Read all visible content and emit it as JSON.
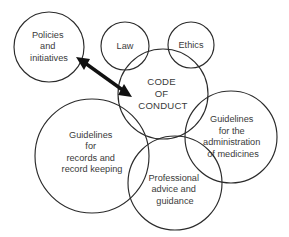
{
  "diagram": {
    "type": "venn-overlapping-circles",
    "title_text": "CODE OF CONDUCT",
    "stroke_color": "#2b2b2b",
    "text_color": "#3a3a3a",
    "arrow_color": "#111111",
    "background_color": "#ffffff",
    "nodes": [
      {
        "id": "policies",
        "name": "policies-and-initiatives",
        "lines": [
          "Policies",
          "and",
          "initiatives"
        ],
        "cx": 49,
        "cy": 47,
        "r": 35
      },
      {
        "id": "law",
        "name": "law",
        "lines": [
          "Law"
        ],
        "cx": 125,
        "cy": 46,
        "r": 24
      },
      {
        "id": "ethics",
        "name": "ethics",
        "lines": [
          "Ethics"
        ],
        "cx": 191,
        "cy": 45,
        "r": 23
      },
      {
        "id": "code-of-conduct",
        "name": "code-of-conduct",
        "lines": [
          "CODE",
          "OF",
          "CONDUCT"
        ],
        "cx": 163,
        "cy": 94,
        "r": 45
      },
      {
        "id": "records",
        "name": "guidelines-for-records-and-record-keeping",
        "lines": [
          "Guidelines",
          "for",
          "records and",
          "record keeping"
        ],
        "cx": 92,
        "cy": 156,
        "r": 57
      },
      {
        "id": "medicines",
        "name": "guidelines-for-the-administration-of-medicines",
        "lines": [
          "Guidelines",
          "for the",
          "administration",
          "of medicines"
        ],
        "cx": 231,
        "cy": 137,
        "r": 46
      },
      {
        "id": "professional",
        "name": "professional-advice-and-guidance",
        "lines": [
          "Professional",
          "advice and",
          "guidance"
        ],
        "cx": 175,
        "cy": 183,
        "r": 47
      }
    ],
    "connector": {
      "name": "double-headed-arrow",
      "from_point": [
        77,
        58
      ],
      "to_point": [
        131,
        96
      ],
      "double_headed": true
    }
  }
}
